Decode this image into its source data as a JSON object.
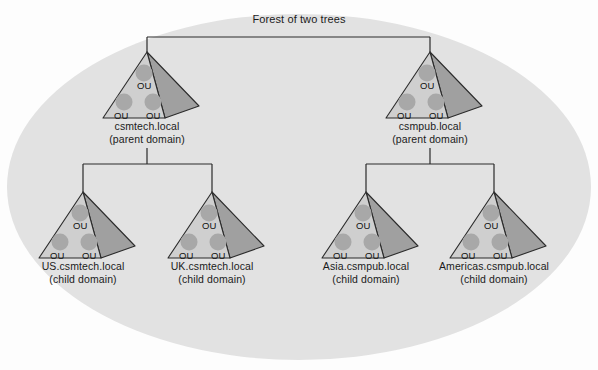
{
  "diagram": {
    "title": "Forest of two trees",
    "ou_label": "OU",
    "colors": {
      "background": "#fdfdfd",
      "oval_fill": "#e2e2e2",
      "pyramid_front": "#cfcfcf",
      "pyramid_side": "#a0a0a0",
      "ou_circle": "#a8a8a8",
      "outline": "#2b2b2b",
      "text": "#1b1b1b"
    },
    "trees": [
      {
        "id": "csmtech",
        "name": "csmtech.local",
        "role": "(parent domain)",
        "level": "parent",
        "ou_count": 3
      },
      {
        "id": "csmpub",
        "name": "csmpub.local",
        "role": "(parent domain)",
        "level": "parent",
        "ou_count": 3
      },
      {
        "id": "us-csmtech",
        "name": "US.csmtech.local",
        "role": "(child domain)",
        "level": "child",
        "parent": "csmtech.local",
        "ou_count": 3
      },
      {
        "id": "uk-csmtech",
        "name": "UK.csmtech.local",
        "role": "(child domain)",
        "level": "child",
        "parent": "csmtech.local",
        "ou_count": 3
      },
      {
        "id": "asia-csmpub",
        "name": "Asia.csmpub.local",
        "role": "(child domain)",
        "level": "child",
        "parent": "csmpub.local",
        "ou_count": 3
      },
      {
        "id": "americas-csmpub",
        "name": "Americas.csmpub.local",
        "role": "(child domain)",
        "level": "child",
        "parent": "csmpub.local",
        "ou_count": 3
      }
    ]
  }
}
